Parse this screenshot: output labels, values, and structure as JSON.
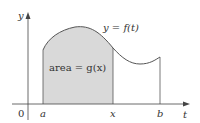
{
  "diagram": {
    "axes": {
      "y_label": "y",
      "x_label": "t",
      "origin_label": "0"
    },
    "curve_label": "y = f(t)",
    "area_label": "area = g(x)",
    "tick_labels": {
      "a": "a",
      "x": "x",
      "b": "b"
    },
    "colors": {
      "shade": "#d9d9d9",
      "curve": "#555555",
      "axis": "#444444"
    }
  }
}
